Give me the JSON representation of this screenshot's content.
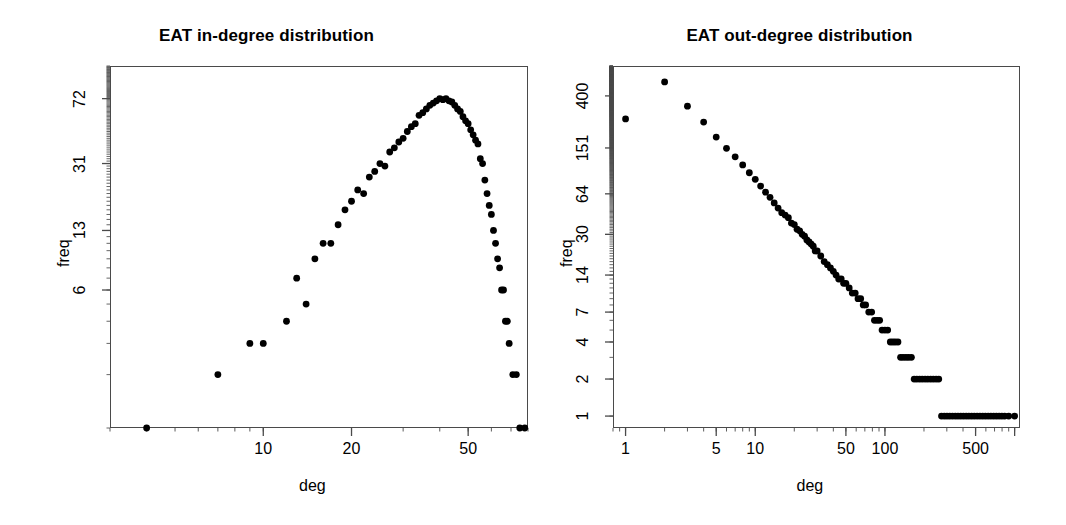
{
  "figure": {
    "background": "#ffffff",
    "point_color": "#000000",
    "axis_color": "#4a4a4a",
    "panel_count": 2
  },
  "chart_data": [
    {
      "type": "scatter",
      "panel": "left",
      "title": "EAT in-degree distribution",
      "xlabel": "deg",
      "ylabel": "freq",
      "xscale": "log",
      "yscale": "log",
      "xticks": [
        10,
        20,
        50
      ],
      "xtick_labels": [
        "10",
        "20",
        "50"
      ],
      "yticks": [
        6,
        13,
        31,
        72
      ],
      "ytick_labels": [
        "6",
        "13",
        "31",
        "72"
      ],
      "xlim": [
        3,
        80
      ],
      "ylim": [
        1,
        110
      ],
      "grid": false,
      "legend": null,
      "description": "Log-log hump-shaped in-degree frequency distribution peaking near deg 38-42",
      "points": [
        [
          4,
          1
        ],
        [
          7,
          2
        ],
        [
          9,
          3
        ],
        [
          10,
          3
        ],
        [
          12,
          4
        ],
        [
          13,
          7
        ],
        [
          14,
          5
        ],
        [
          15,
          9
        ],
        [
          16,
          11
        ],
        [
          17,
          11
        ],
        [
          18,
          14
        ],
        [
          19,
          17
        ],
        [
          20,
          19
        ],
        [
          21,
          22
        ],
        [
          22,
          21
        ],
        [
          23,
          26
        ],
        [
          24,
          28
        ],
        [
          25,
          31
        ],
        [
          26,
          30
        ],
        [
          27,
          36
        ],
        [
          28,
          38
        ],
        [
          29,
          41
        ],
        [
          30,
          43
        ],
        [
          31,
          47
        ],
        [
          32,
          50
        ],
        [
          33,
          52
        ],
        [
          34,
          58
        ],
        [
          35,
          60
        ],
        [
          36,
          63
        ],
        [
          37,
          66
        ],
        [
          38,
          68
        ],
        [
          39,
          70
        ],
        [
          40,
          72
        ],
        [
          41,
          71
        ],
        [
          42,
          72
        ],
        [
          43,
          70
        ],
        [
          44,
          69
        ],
        [
          45,
          66
        ],
        [
          46,
          63
        ],
        [
          47,
          61
        ],
        [
          48,
          57
        ],
        [
          49,
          54
        ],
        [
          50,
          52
        ],
        [
          51,
          48
        ],
        [
          52,
          45
        ],
        [
          53,
          42
        ],
        [
          54,
          40
        ],
        [
          55,
          33
        ],
        [
          56,
          31
        ],
        [
          57,
          25
        ],
        [
          58,
          21
        ],
        [
          59,
          18
        ],
        [
          60,
          16
        ],
        [
          61,
          13
        ],
        [
          62,
          11
        ],
        [
          63,
          9
        ],
        [
          64,
          8
        ],
        [
          65,
          6
        ],
        [
          66,
          6
        ],
        [
          67,
          4
        ],
        [
          68,
          4
        ],
        [
          69,
          3
        ],
        [
          71,
          2
        ],
        [
          73,
          2
        ],
        [
          75,
          1
        ],
        [
          78,
          1
        ]
      ]
    },
    {
      "type": "scatter",
      "panel": "right",
      "title": "EAT out-degree distribution",
      "xlabel": "deg",
      "ylabel": "freq",
      "xscale": "log",
      "yscale": "log",
      "xticks": [
        1,
        5,
        10,
        50,
        100,
        500
      ],
      "xtick_labels": [
        "1",
        "5",
        "10",
        "50",
        "100",
        "500"
      ],
      "yticks": [
        1,
        2,
        4,
        7,
        14,
        30,
        64,
        151,
        400
      ],
      "ytick_labels": [
        "1",
        "2",
        "4",
        "7",
        "14",
        "30",
        "64",
        "151",
        "400"
      ],
      "xlim": [
        0.8,
        1100
      ],
      "ylim": [
        0.8,
        700
      ],
      "grid": false,
      "legend": null,
      "description": "Log-log power-law decaying out-degree distribution with horizontal bands at low frequencies in the tail",
      "points": [
        [
          1,
          260
        ],
        [
          2,
          520
        ],
        [
          3,
          330
        ],
        [
          4,
          245
        ],
        [
          5,
          185
        ],
        [
          6,
          150
        ],
        [
          7,
          128
        ],
        [
          8,
          110
        ],
        [
          9,
          95
        ],
        [
          10,
          84
        ],
        [
          11,
          74
        ],
        [
          12,
          66
        ],
        [
          13,
          60
        ],
        [
          14,
          54
        ],
        [
          15,
          49
        ],
        [
          16,
          45
        ],
        [
          17,
          43
        ],
        [
          18,
          41
        ],
        [
          19,
          37
        ],
        [
          20,
          36
        ],
        [
          21,
          33
        ],
        [
          22,
          32
        ],
        [
          23,
          30
        ],
        [
          24,
          29
        ],
        [
          25,
          27
        ],
        [
          26,
          26
        ],
        [
          27,
          25
        ],
        [
          28,
          24
        ],
        [
          29,
          22
        ],
        [
          30,
          22
        ],
        [
          32,
          20
        ],
        [
          34,
          18
        ],
        [
          36,
          17
        ],
        [
          38,
          16
        ],
        [
          40,
          15
        ],
        [
          42,
          14
        ],
        [
          44,
          13
        ],
        [
          46,
          13
        ],
        [
          48,
          12
        ],
        [
          50,
          12
        ],
        [
          53,
          11
        ],
        [
          56,
          10
        ],
        [
          59,
          10
        ],
        [
          62,
          9
        ],
        [
          65,
          9
        ],
        [
          68,
          8
        ],
        [
          71,
          8
        ],
        [
          75,
          7
        ],
        [
          79,
          7
        ],
        [
          83,
          6
        ],
        [
          87,
          6
        ],
        [
          91,
          6
        ],
        [
          95,
          5
        ],
        [
          100,
          5
        ],
        [
          105,
          5
        ],
        [
          110,
          4
        ],
        [
          115,
          4
        ],
        [
          120,
          4
        ],
        [
          126,
          4
        ],
        [
          132,
          3
        ],
        [
          138,
          3
        ],
        [
          145,
          3
        ],
        [
          152,
          3
        ],
        [
          160,
          3
        ],
        [
          168,
          2
        ],
        [
          176,
          2
        ],
        [
          185,
          2
        ],
        [
          194,
          2
        ],
        [
          204,
          2
        ],
        [
          214,
          2
        ],
        [
          225,
          2
        ],
        [
          236,
          2
        ],
        [
          248,
          2
        ],
        [
          260,
          2
        ],
        [
          273,
          1
        ],
        [
          287,
          1
        ],
        [
          301,
          1
        ],
        [
          316,
          1
        ],
        [
          332,
          1
        ],
        [
          349,
          1
        ],
        [
          366,
          1
        ],
        [
          384,
          1
        ],
        [
          403,
          1
        ],
        [
          423,
          1
        ],
        [
          444,
          1
        ],
        [
          466,
          1
        ],
        [
          489,
          1
        ],
        [
          514,
          1
        ],
        [
          540,
          1
        ],
        [
          567,
          1
        ],
        [
          595,
          1
        ],
        [
          625,
          1
        ],
        [
          656,
          1
        ],
        [
          689,
          1
        ],
        [
          723,
          1
        ],
        [
          759,
          1
        ],
        [
          797,
          1
        ],
        [
          837,
          1
        ],
        [
          900,
          1
        ],
        [
          1000,
          1
        ]
      ]
    }
  ]
}
